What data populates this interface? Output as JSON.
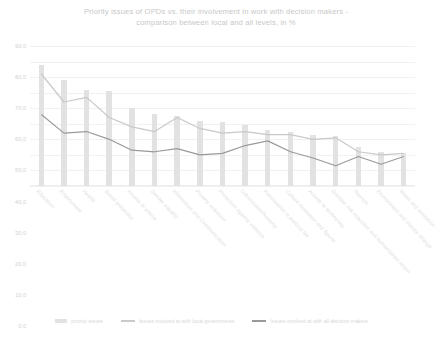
{
  "chart_data": {
    "type": "bar",
    "title": "Priority issues of OPDs vs. their involvement in work with decision makers - comparison between local and all levels, in %",
    "title_line1": "Priority issues of OPDs vs. their involvement in work with decision makers -",
    "title_line2": "comparison between local and all levels, in %",
    "xlabel": "",
    "ylabel": "",
    "ylim": [
      0,
      90
    ],
    "grid": true,
    "legend_position": "bottom",
    "yticks": [
      "0,0",
      "10,0",
      "20,0",
      "30,0",
      "40,0",
      "50,0",
      "60,0",
      "70,0",
      "80,0",
      "90,0"
    ],
    "ytick_values": [
      0,
      10,
      20,
      30,
      40,
      50,
      60,
      70,
      80,
      90
    ],
    "categories": [
      "Education",
      "Employment",
      "Health",
      "Social protection",
      "Access to justice",
      "Gender equality",
      "Information and Communication",
      "Poverty reduction",
      "Protection against violence",
      "Urbanization/housing",
      "Participation in political life",
      "Culture recreation and Sports",
      "Access to technology",
      "Disaster risk reduction and humanitarian action",
      "Tourism",
      "Environment and climate change",
      "Water and sanitation"
    ],
    "series": [
      {
        "name": "priority issues",
        "type": "bar",
        "color": "#e2e2e2",
        "values": [
          78.0,
          68.0,
          62.0,
          61.0,
          50.0,
          46.0,
          45.0,
          42.0,
          41.0,
          39.0,
          36.0,
          35.0,
          33.0,
          32.0,
          25.0,
          22.0,
          21.0
        ]
      },
      {
        "name": "Issues involved at with local governments",
        "type": "line",
        "color": "#c9c9c9",
        "values": [
          72.0,
          54.0,
          57.0,
          44.0,
          38.0,
          35.0,
          44.0,
          37.0,
          34.0,
          35.0,
          33.0,
          33.0,
          30.0,
          31.0,
          22.0,
          20.0,
          21.0
        ]
      },
      {
        "name": "Issues involved at with all decision makers",
        "type": "line",
        "color": "#9a9a9a",
        "values": [
          46.0,
          34.0,
          35.0,
          30.0,
          23.0,
          22.0,
          24.0,
          20.0,
          21.0,
          26.0,
          29.0,
          22.0,
          18.0,
          13.0,
          19.0,
          14.0,
          19.0
        ]
      }
    ]
  },
  "legend": {
    "items": [
      {
        "label": "priority issues",
        "color": "#e2e2e2",
        "marker": "bar-swatch"
      },
      {
        "label": "Issues involved at with local governments",
        "color": "#c9c9c9",
        "marker": "line-swatch"
      },
      {
        "label": "Issues involved at with all decision makers",
        "color": "#9a9a9a",
        "marker": "line-swatch"
      }
    ]
  }
}
